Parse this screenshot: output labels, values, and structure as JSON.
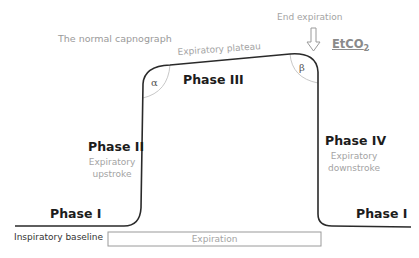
{
  "title": "The normal capnograph",
  "labels": {
    "plateau": "Expiratory plateau",
    "end_expiration": "End expiration",
    "etco2_main": "EtCO",
    "etco2_sub": "2",
    "alpha": "α",
    "beta": "β",
    "phase_1_left": "Phase I",
    "phase_2": "Phase II",
    "phase_2_desc_1": "Expiratory",
    "phase_2_desc_2": "upstroke",
    "phase_3": "Phase III",
    "phase_4": "Phase IV",
    "phase_4_desc_1": "Expiratory",
    "phase_4_desc_2": "downstroke",
    "phase_1_right": "Phase I",
    "baseline": "Inspiratory baseline",
    "expiration_box": "Expiration"
  },
  "colors": {
    "curve": "#2a2a2a",
    "angle_arc": "#c8c8c8",
    "arrow": "#9a9a9a",
    "box_border": "#9a9a9a"
  }
}
